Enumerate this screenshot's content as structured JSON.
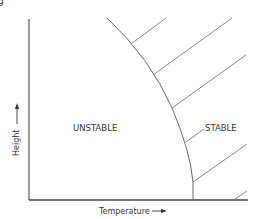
{
  "figure": {
    "corner_mark": "g",
    "x_axis_label": "Temperature",
    "y_axis_label": "Height",
    "region_left_label": "UNSTABLE",
    "region_right_label": "STABLE",
    "line_color": "#6b6b6b",
    "axis_color": "#444444",
    "text_color": "#333333"
  }
}
